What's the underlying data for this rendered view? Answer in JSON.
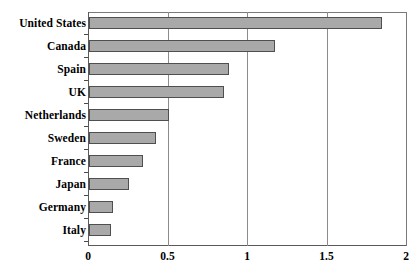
{
  "chart_data": {
    "type": "bar",
    "orientation": "horizontal",
    "title": "",
    "xlabel": "",
    "ylabel": "",
    "categories": [
      "United States",
      "Canada",
      "Spain",
      "UK",
      "Netherlands",
      "Sweden",
      "France",
      "Japan",
      "Germany",
      "Italy"
    ],
    "values": [
      1.84,
      1.17,
      0.88,
      0.85,
      0.5,
      0.42,
      0.34,
      0.25,
      0.15,
      0.14
    ],
    "xlim": [
      0,
      2
    ],
    "xticks": [
      0,
      0.5,
      1,
      1.5,
      2
    ],
    "xtick_labels": [
      "0",
      "0.5",
      "1",
      "1.5",
      "2"
    ],
    "grid": true,
    "grid_axis": "x",
    "legend": null,
    "bar_fill_color": "#a9a9a9",
    "bar_edge_color": "#4f4f4f",
    "axis_color": "#5a5a5a",
    "gridline_color": "#8c8c8c",
    "background_color": "#ffffff"
  }
}
